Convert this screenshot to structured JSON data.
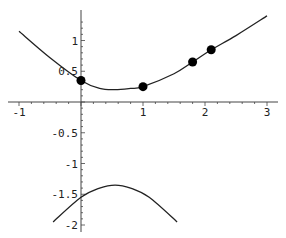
{
  "chart_data": {
    "type": "line",
    "title": "",
    "xlabel": "",
    "ylabel": "",
    "xlim": [
      -1,
      3
    ],
    "ylim": [
      -2,
      1.4
    ],
    "grid": false,
    "legend": null,
    "x_ticks": [
      "-1",
      "1",
      "2",
      "3"
    ],
    "y_ticks": [
      "1",
      "0.5",
      "-0.5",
      "-1",
      "-1.5",
      "-2"
    ],
    "series": [
      {
        "name": "upper-branch",
        "kind": "curve",
        "x": [
          -1,
          -0.5,
          0,
          0.3,
          0.55,
          0.8,
          1,
          1.5,
          1.8,
          2.1,
          2.5,
          3
        ],
        "y": [
          1.15,
          0.72,
          0.35,
          0.22,
          0.2,
          0.22,
          0.25,
          0.46,
          0.65,
          0.85,
          1.08,
          1.4
        ]
      },
      {
        "name": "lower-branch",
        "kind": "curve",
        "x": [
          -0.45,
          0,
          0.3,
          0.55,
          0.8,
          1.1,
          1.55
        ],
        "y": [
          -1.95,
          -1.55,
          -1.4,
          -1.35,
          -1.4,
          -1.55,
          -1.95
        ]
      },
      {
        "name": "points",
        "kind": "scatter",
        "x": [
          0,
          1,
          1.8,
          2.1
        ],
        "y": [
          0.35,
          0.25,
          0.65,
          0.85
        ]
      }
    ]
  },
  "axis": {
    "x_labels": [
      {
        "text": "-1",
        "value": -1
      },
      {
        "text": "1",
        "value": 1
      },
      {
        "text": "2",
        "value": 2
      },
      {
        "text": "3",
        "value": 3
      }
    ],
    "y_labels": [
      {
        "text": "1",
        "value": 1
      },
      {
        "text": "0.5",
        "value": 0.5
      },
      {
        "text": "-0.5",
        "value": -0.5
      },
      {
        "text": "-1",
        "value": -1
      },
      {
        "text": "-1.5",
        "value": -1.5
      },
      {
        "text": "-2",
        "value": -2
      }
    ]
  },
  "colors": {
    "curve": "#222222",
    "points": "#000000",
    "axis": "#444444"
  }
}
